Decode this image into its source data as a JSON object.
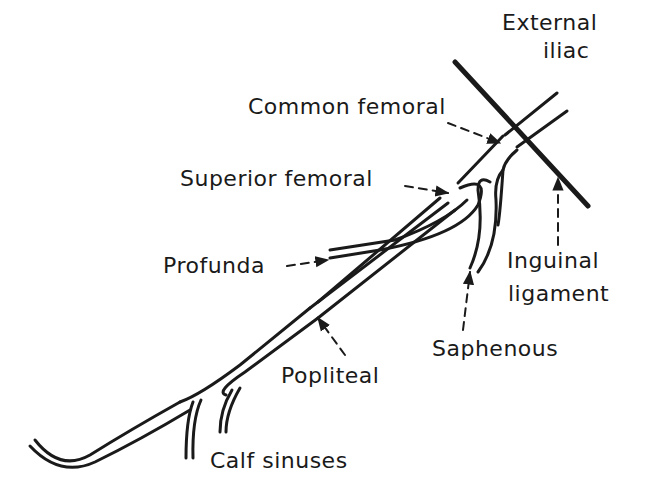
{
  "diagram": {
    "colors": {
      "ink": "#1a1a1a",
      "background": "#ffffff"
    },
    "labels": {
      "external_iliac_line1": "External",
      "external_iliac_line2": "iliac",
      "common_femoral": "Common femoral",
      "superior_femoral": "Superior femoral",
      "profunda": "Profunda",
      "inguinal_line1": "Inguinal",
      "inguinal_line2": "ligament",
      "saphenous": "Saphenous",
      "popliteal": "Popliteal",
      "calf_sinuses": "Calf sinuses"
    },
    "structures": [
      "External iliac vein",
      "Inguinal ligament",
      "Common femoral vein",
      "Superior femoral vein",
      "Profunda vein",
      "Saphenous vein",
      "Popliteal vein",
      "Calf sinuses"
    ]
  }
}
